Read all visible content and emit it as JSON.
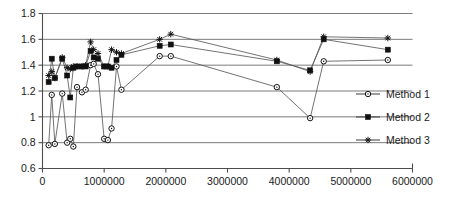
{
  "chart_data": {
    "type": "line",
    "title": "",
    "subtitle": "",
    "xlabel": "",
    "ylabel": "",
    "xlim": [
      0,
      6000000
    ],
    "ylim": [
      0.6,
      1.8
    ],
    "xticks": [
      0,
      1000000,
      2000000,
      3000000,
      4000000,
      5000000,
      6000000
    ],
    "xtick_labels": [
      "0",
      "1000000",
      "2000000",
      "3000000",
      "4000000",
      "5000000",
      "6000000"
    ],
    "yticks": [
      0.6,
      0.8,
      1.0,
      1.2,
      1.4,
      1.6,
      1.8
    ],
    "ytick_labels": [
      "0.6",
      "0.8",
      "1",
      "1.2",
      "1.4",
      "1.6",
      "1.8"
    ],
    "grid": "horizontal",
    "legend_position": "right",
    "series": [
      {
        "name": "Method 1",
        "marker": "open-circle",
        "x": [
          100000,
          150000,
          200000,
          320000,
          400000,
          450000,
          500000,
          560000,
          640000,
          700000,
          780000,
          830000,
          900000,
          1000000,
          1060000,
          1120000,
          1200000,
          1280000,
          1900000,
          2080000,
          3800000,
          4340000,
          4560000,
          5600000
        ],
        "y": [
          0.78,
          1.17,
          0.79,
          1.18,
          0.8,
          0.83,
          0.77,
          1.23,
          1.19,
          1.21,
          1.4,
          1.41,
          1.33,
          0.83,
          0.82,
          0.91,
          1.39,
          1.21,
          1.47,
          1.47,
          1.23,
          0.99,
          1.43,
          1.44
        ]
      },
      {
        "name": "Method 2",
        "marker": "filled-square",
        "x": [
          100000,
          150000,
          200000,
          320000,
          400000,
          450000,
          500000,
          560000,
          640000,
          700000,
          780000,
          830000,
          900000,
          1000000,
          1060000,
          1120000,
          1200000,
          1280000,
          1900000,
          2080000,
          3800000,
          4340000,
          4560000,
          5600000
        ],
        "y": [
          1.27,
          1.45,
          1.3,
          1.45,
          1.32,
          1.15,
          1.38,
          1.39,
          1.39,
          1.39,
          1.51,
          1.46,
          1.45,
          1.39,
          1.39,
          1.38,
          1.44,
          1.48,
          1.55,
          1.56,
          1.43,
          1.36,
          1.6,
          1.52
        ]
      },
      {
        "name": "Method 3",
        "marker": "asterisk",
        "x": [
          100000,
          150000,
          200000,
          320000,
          400000,
          450000,
          500000,
          560000,
          640000,
          700000,
          780000,
          830000,
          900000,
          1000000,
          1060000,
          1120000,
          1200000,
          1280000,
          1900000,
          2080000,
          3800000,
          4340000,
          4560000,
          5600000
        ],
        "y": [
          1.32,
          1.35,
          1.3,
          1.46,
          1.38,
          1.37,
          1.39,
          1.39,
          1.39,
          1.4,
          1.58,
          1.52,
          1.49,
          1.39,
          1.39,
          1.52,
          1.5,
          1.49,
          1.6,
          1.64,
          1.44,
          1.35,
          1.62,
          1.61
        ]
      }
    ]
  },
  "legend": {
    "items": [
      {
        "label": "Method 1",
        "marker": "open-circle"
      },
      {
        "label": "Method 2",
        "marker": "filled-square"
      },
      {
        "label": "Method 3",
        "marker": "asterisk"
      }
    ]
  }
}
